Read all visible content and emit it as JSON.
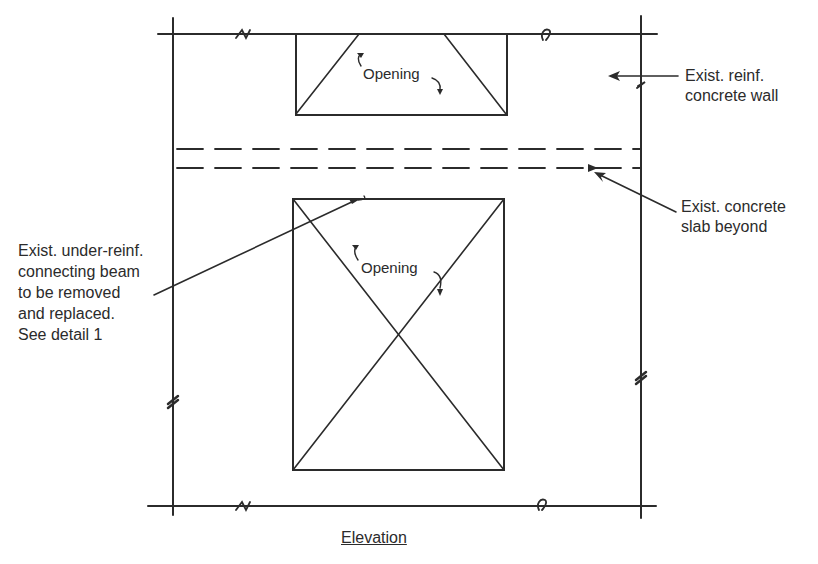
{
  "diagram": {
    "title": "Elevation",
    "openings": [
      {
        "label": "Opening"
      },
      {
        "label": "Opening"
      }
    ],
    "callouts": {
      "wall": {
        "lines": [
          "Exist. reinf.",
          "concrete wall"
        ]
      },
      "slab": {
        "lines": [
          "Exist. concrete",
          "slab beyond"
        ]
      },
      "beam": {
        "lines": [
          "Exist. under-reinf.",
          "connecting beam",
          "to be removed",
          "and replaced.",
          "See detail 1"
        ]
      }
    },
    "colors": {
      "line": "#2b2b2b",
      "background": "#ffffff"
    }
  }
}
